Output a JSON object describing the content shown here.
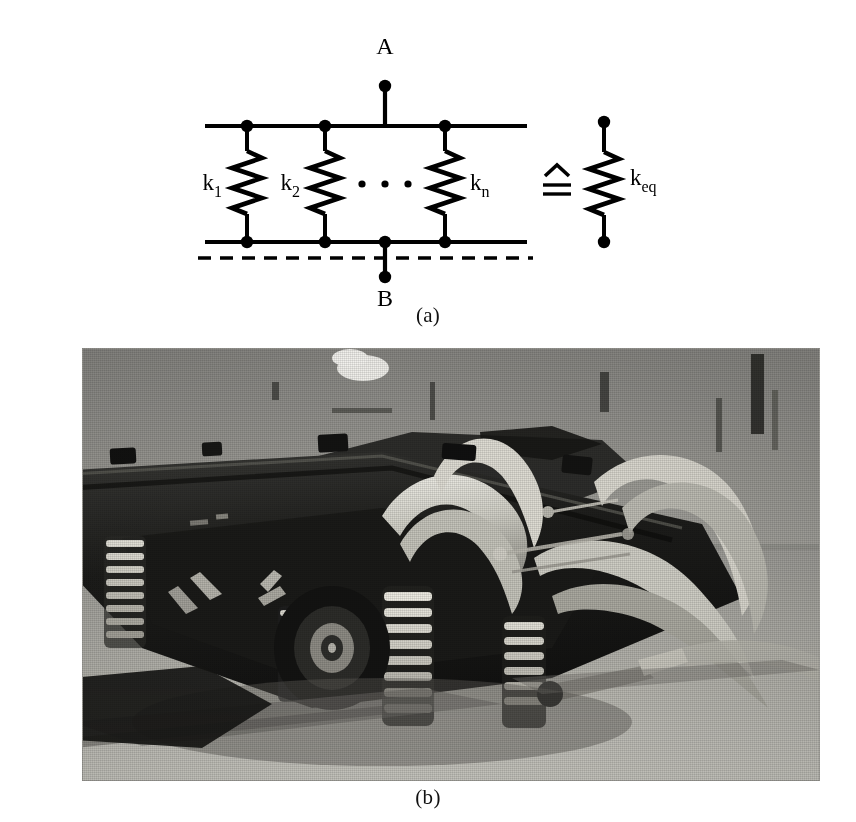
{
  "figure": {
    "panel_a": {
      "caption": "(a)",
      "terminal_top_label": "A",
      "terminal_bottom_label": "B",
      "equivalence_symbol": "≙",
      "ellipsis_dot_count": 3,
      "springs": [
        {
          "id": "spring-1",
          "label_base": "k",
          "label_sub": "1",
          "label_full": "k1"
        },
        {
          "id": "spring-2",
          "label_base": "k",
          "label_sub": "2",
          "label_full": "k2"
        },
        {
          "id": "spring-n",
          "label_base": "k",
          "label_sub": "n",
          "label_full": "kn"
        }
      ],
      "equivalent_spring": {
        "id": "spring-eq",
        "label_base": "k",
        "label_sub": "eq",
        "label_full": "keq"
      },
      "colors": {
        "ink": "#000000",
        "paper": "#ffffff"
      }
    },
    "panel_b": {
      "caption": "(b)",
      "subject": "railway-bogie-photograph",
      "colors": {
        "paper_gray": "#8d8d8a",
        "shadow": "#1b1b1a",
        "highlight": "#e6e4dd"
      }
    }
  }
}
